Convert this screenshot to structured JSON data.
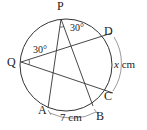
{
  "diagram": {
    "type": "circle-inscribed-angles",
    "colors": {
      "stroke": "#333333",
      "text": "#222222",
      "background": "#ffffff"
    },
    "circle": {
      "cx": 66,
      "cy": 65,
      "r": 46
    },
    "points": {
      "P": {
        "label": "P",
        "x": 61,
        "y": 19
      },
      "Q": {
        "label": "Q",
        "x": 21,
        "y": 62
      },
      "D": {
        "label": "D",
        "x": 107,
        "y": 36
      },
      "C": {
        "label": "C",
        "x": 106,
        "y": 91
      },
      "A": {
        "label": "A",
        "x": 48,
        "y": 108
      },
      "B": {
        "label": "B",
        "x": 93,
        "y": 106
      }
    },
    "segments": [
      {
        "from": "P",
        "to": "A"
      },
      {
        "from": "P",
        "to": "B"
      },
      {
        "from": "Q",
        "to": "D"
      },
      {
        "from": "Q",
        "to": "C"
      }
    ],
    "angles": {
      "APB": {
        "vertex": "P",
        "label": "30°"
      },
      "DQC": {
        "vertex": "Q",
        "label": "30°"
      }
    },
    "arcs": {
      "AB": {
        "label": "7 cm"
      },
      "DC": {
        "label_var": "x",
        "label_unit": " cm"
      }
    }
  }
}
